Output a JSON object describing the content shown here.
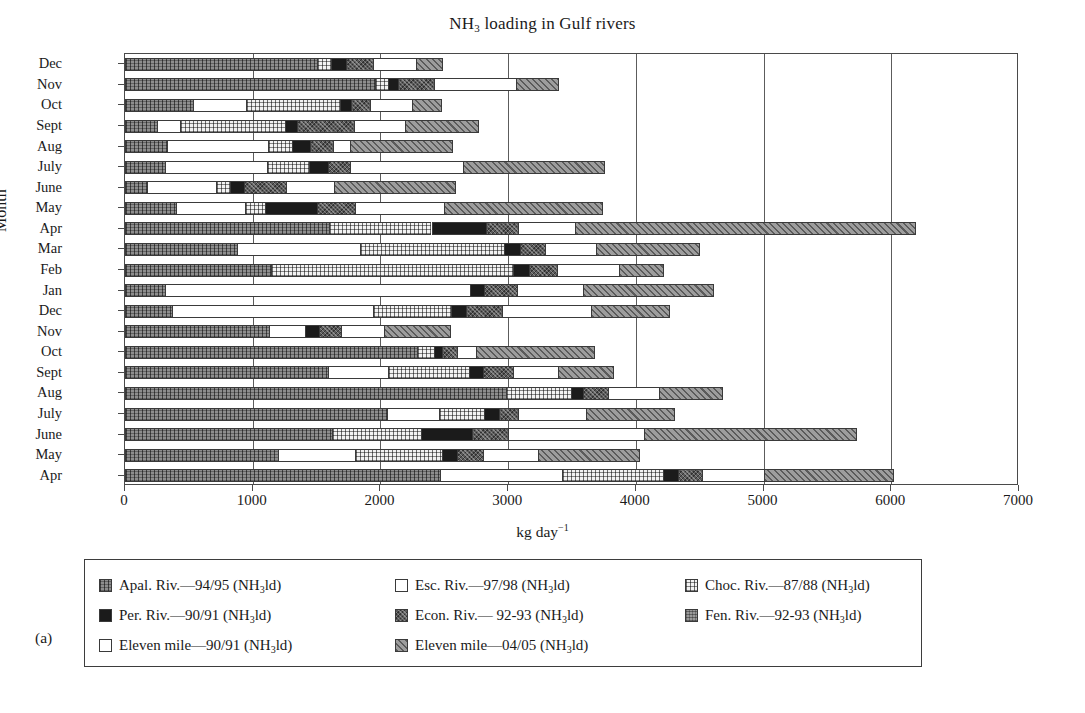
{
  "figure": {
    "panel_label": "(a)",
    "title_html": "NH<sub>3</sub> loading in Gulf rivers",
    "title_plain": "NH3 loading in Gulf rivers"
  },
  "axes": {
    "x_title_html": "kg day<sup>−1</sup>",
    "x_title_plain": "kg day-1",
    "y_title": "Month",
    "x_ticks": [
      0,
      1000,
      2000,
      3000,
      4000,
      5000,
      6000,
      7000
    ],
    "x_tick_labels": [
      "0",
      "1000",
      "2000",
      "3000",
      "4000",
      "5000",
      "6000",
      "7000"
    ],
    "x_min": 0,
    "x_max": 7000,
    "grid": "vertical"
  },
  "legend": {
    "entries": [
      {
        "key": "apal",
        "label_html": "Apal. Riv.—94/95 (NH<sub>3</sub>ld)",
        "label_plain": "Apal. Riv.-94/95 (NH3ld)",
        "swatch": "p-apal"
      },
      {
        "key": "esc",
        "label_html": "Esc. Riv.—97/98 (NH<sub>3</sub>ld)",
        "label_plain": "Esc. Riv.-97/98 (NH3ld)",
        "swatch": "p-esc"
      },
      {
        "key": "choc",
        "label_html": "Choc. Riv.—87/88 (NH<sub>3</sub>ld)",
        "label_plain": "Choc. Riv.-87/88 (NH3ld)",
        "swatch": "p-choc"
      },
      {
        "key": "per",
        "label_html": "Per. Riv.—90/91 (NH<sub>3</sub>ld)",
        "label_plain": "Per. Riv.-90/91 (NH3ld)",
        "swatch": "p-per"
      },
      {
        "key": "econ",
        "label_html": "Econ. Riv.— 92-93 (NH<sub>3</sub>ld)",
        "label_plain": "Econ. Riv.- 92-93 (NH3ld)",
        "swatch": "p-econ"
      },
      {
        "key": "fen",
        "label_html": "Fen. Riv.—92-93 (NH<sub>3</sub>ld)",
        "label_plain": "Fen. Riv.-92-93 (NH3ld)",
        "swatch": "p-fen"
      },
      {
        "key": "el90",
        "label_html": "Eleven mile—90/91 (NH<sub>3</sub>ld)",
        "label_plain": "Eleven mile-90/91 (NH3ld)",
        "swatch": "p-el90"
      },
      {
        "key": "el04",
        "label_html": "Eleven mile—04/05 (NH<sub>3</sub>ld)",
        "label_plain": "Eleven mile-04/05 (NH3ld)",
        "swatch": "p-el04"
      }
    ]
  },
  "chart_data": {
    "type": "bar",
    "orientation": "horizontal",
    "stacked": true,
    "title": "NH3 loading in Gulf rivers",
    "xlabel": "kg day-1",
    "ylabel": "Month",
    "xlim": [
      0,
      7000
    ],
    "categories": [
      "Dec",
      "Nov",
      "Oct",
      "Sept",
      "Aug",
      "July",
      "June",
      "May",
      "Apr",
      "Mar",
      "Feb",
      "Jan",
      "Dec",
      "Nov",
      "Oct",
      "Sept",
      "Aug",
      "July",
      "June",
      "May",
      "Apr"
    ],
    "series_order": [
      "apal",
      "esc",
      "choc",
      "per",
      "econ",
      "el90",
      "el04"
    ],
    "series": [
      {
        "name": "Apal. Riv.-94/95 (NH3ld)",
        "key": "apal",
        "swatch": "p-apal",
        "values": [
          1500,
          1960,
          530,
          250,
          330,
          310,
          170,
          400,
          1600,
          880,
          1140,
          310,
          370,
          1130,
          2290,
          1590,
          2980,
          2050,
          1620,
          1200,
          2470
        ]
      },
      {
        "name": "Esc. Riv.-97/98 (NH3ld)",
        "key": "esc",
        "swatch": "p-esc",
        "values": [
          0,
          0,
          420,
          180,
          790,
          800,
          540,
          540,
          0,
          960,
          0,
          2390,
          1570,
          280,
          0,
          470,
          0,
          410,
          0,
          600,
          950
        ]
      },
      {
        "name": "Choc. Riv.-87/88 (NH3ld)",
        "key": "choc",
        "swatch": "p-choc",
        "values": [
          110,
          100,
          730,
          820,
          190,
          330,
          110,
          160,
          800,
          1130,
          1900,
          0,
          610,
          0,
          130,
          630,
          510,
          350,
          700,
          680,
          790
        ]
      },
      {
        "name": "Per. Riv.-90/91 (NH3ld)",
        "key": "per",
        "swatch": "p-per",
        "values": [
          120,
          80,
          90,
          100,
          140,
          150,
          110,
          400,
          430,
          120,
          120,
          110,
          120,
          110,
          60,
          110,
          100,
          120,
          400,
          120,
          120
        ]
      },
      {
        "name": "Econ. Riv.- 92-93 (NH3ld)",
        "key": "econ",
        "swatch": "p-econ",
        "values": [
          210,
          280,
          150,
          440,
          180,
          170,
          330,
          300,
          250,
          200,
          220,
          260,
          280,
          170,
          120,
          240,
          190,
          150,
          280,
          200,
          190
        ]
      },
      {
        "name": "Eleven mile-90/91 (NH3ld)",
        "key": "el90",
        "swatch": "p-el90",
        "values": [
          340,
          640,
          330,
          400,
          130,
          890,
          380,
          700,
          440,
          400,
          490,
          520,
          700,
          340,
          150,
          350,
          400,
          530,
          1060,
          430,
          480
        ]
      },
      {
        "name": "Eleven mile-04/05 (NH3ld)",
        "key": "el04",
        "swatch": "p-el04",
        "values": [
          210,
          340,
          230,
          580,
          810,
          1110,
          950,
          1240,
          2670,
          810,
          350,
          1020,
          620,
          520,
          930,
          440,
          500,
          700,
          1670,
          800,
          1020
        ]
      }
    ],
    "totals": [
      2490,
      3400,
      2480,
      2770,
      2570,
      3760,
      2590,
      3740,
      6190,
      4500,
      4220,
      4610,
      4270,
      2550,
      3680,
      3830,
      4680,
      4310,
      5730,
      4030,
      6020
    ]
  }
}
